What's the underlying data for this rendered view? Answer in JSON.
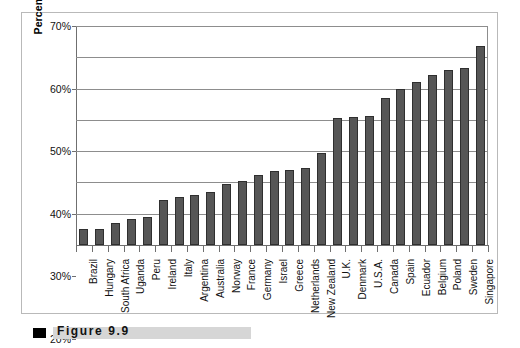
{
  "figure": {
    "caption_label": "Figure  9.9",
    "bullet_icon": "square-bullet-icon"
  },
  "colors": {
    "bar_fill": "#565656",
    "bar_border": "#2f2f2f",
    "gridline": "#8d8d8d",
    "axis": "#6f6f6f",
    "panel_border": "#b9b9b9",
    "caption_rule": "#d6d6d6",
    "caption_bullet": "#000000",
    "text": "#111111",
    "background": "#ffffff"
  },
  "chart_data": {
    "type": "bar",
    "title": "",
    "subtitle": "",
    "xlabel": "",
    "ylabel": "Percent of Nascents",
    "ylim": [
      0,
      70
    ],
    "ytick_values": [
      0,
      10,
      20,
      30,
      40,
      50,
      60,
      70
    ],
    "ytick_labels": [
      "0%",
      "10%",
      "20%",
      "30%",
      "40%",
      "50%",
      "60%",
      "70%"
    ],
    "grid": true,
    "grid_axis": "y",
    "legend": false,
    "legend_position": "none",
    "orientation": "vertical",
    "categories": [
      "Brazil",
      "Hungary",
      "South Africa",
      "Uganda",
      "Peru",
      "Ireland",
      "Italy",
      "Argentina",
      "Australia",
      "Norway",
      "France",
      "Germany",
      "Israel",
      "Greece",
      "Netherlands",
      "New Zealand",
      "U.K.",
      "Denmark",
      "U.S.A.",
      "Canada",
      "Spain",
      "Ecuador",
      "Belgium",
      "Poland",
      "Sweden",
      "Singapore"
    ],
    "values": [
      5.0,
      5.2,
      7.0,
      8.2,
      9.0,
      14.5,
      15.5,
      16.0,
      17.0,
      19.5,
      20.5,
      22.5,
      23.5,
      24.0,
      24.5,
      29.5,
      40.5,
      40.8,
      41.2,
      47.0,
      50.0,
      52.0,
      54.5,
      56.0,
      56.5,
      63.5
    ],
    "value_unit": "%",
    "series": [
      {
        "name": "Percent of Nascents",
        "values": [
          5.0,
          5.2,
          7.0,
          8.2,
          9.0,
          14.5,
          15.5,
          16.0,
          17.0,
          19.5,
          20.5,
          22.5,
          23.5,
          24.0,
          24.5,
          29.5,
          40.5,
          40.8,
          41.2,
          47.0,
          50.0,
          52.0,
          54.5,
          56.0,
          56.5,
          63.5
        ]
      }
    ]
  }
}
